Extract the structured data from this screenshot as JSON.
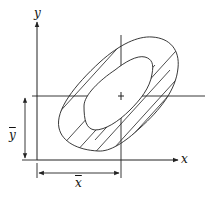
{
  "diagram": {
    "type": "bivariate-contour-sketch",
    "axes": {
      "x_label": "x",
      "y_label": "y"
    },
    "means": {
      "x_mean_label": "x",
      "y_mean_label": "y",
      "x_mean_notation": "x-bar",
      "y_mean_notation": "y-bar"
    },
    "contours": [
      {
        "name": "outer",
        "hatched_band": true
      },
      {
        "name": "inner",
        "hatched_band": false
      }
    ],
    "colors": {
      "ink": "#222222",
      "background": "#ffffff"
    }
  }
}
